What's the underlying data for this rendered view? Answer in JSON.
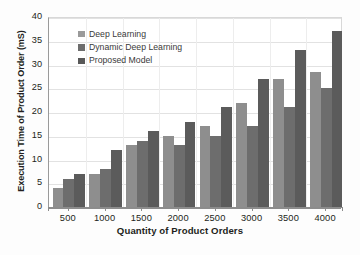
{
  "chart_data": {
    "type": "bar",
    "title": "",
    "xlabel": "Quantity of Product Orders",
    "ylabel": "Execution Time of Product Order (mS)",
    "categories": [
      "500",
      "1000",
      "1500",
      "2000",
      "2500",
      "3000",
      "3500",
      "4000"
    ],
    "series": [
      {
        "name": "Deep Learning",
        "color": "#8e8e8e",
        "values": [
          4,
          7,
          13,
          15,
          17,
          22,
          27,
          28.5
        ]
      },
      {
        "name": "Dynamic Deep Learning",
        "color": "#6d6d6d",
        "values": [
          6,
          8,
          14,
          13,
          15,
          17,
          21,
          25
        ]
      },
      {
        "name": "Proposed Model",
        "color": "#5b5b5b",
        "values": [
          7,
          12,
          16,
          18,
          21,
          27,
          33,
          37
        ]
      }
    ],
    "ylim": [
      0,
      40
    ],
    "yticks": [
      "0",
      "5",
      "10",
      "15",
      "20",
      "25",
      "30",
      "35",
      "40"
    ],
    "grid": true,
    "legend_position": "top-left",
    "units": "mS"
  },
  "legend": {
    "items": [
      {
        "label": "Deep Learning"
      },
      {
        "label": "Dynamic Deep Learning"
      },
      {
        "label": "Proposed Model"
      }
    ]
  }
}
